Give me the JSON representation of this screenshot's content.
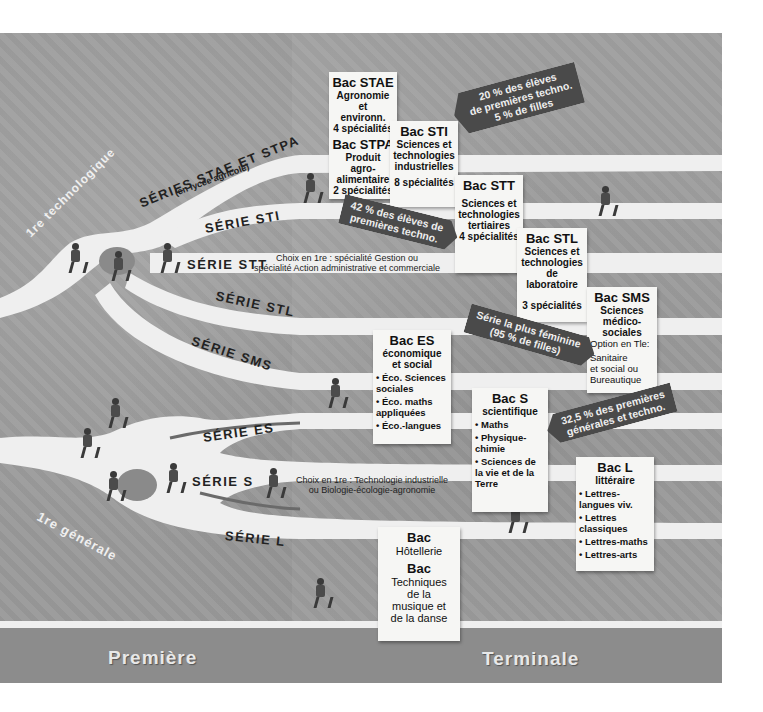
{
  "stages": {
    "premiere": "Première",
    "terminale": "Terminale"
  },
  "entry_labels": {
    "techno": "1re technologique",
    "generale": "1re générale"
  },
  "series": [
    {
      "id": "stae_stpa",
      "label": "SÉRIES STAE ET STPA",
      "sublabel": "(en lycée agricole)"
    },
    {
      "id": "sti",
      "label": "SÉRIE STI"
    },
    {
      "id": "stt",
      "label": "SÉRIE STT",
      "note_line1": "Choix en 1re : spécialité Gestion ou",
      "note_line2": "spécialité Action administrative et commerciale"
    },
    {
      "id": "stl",
      "label": "SÉRIE STL"
    },
    {
      "id": "sms",
      "label": "SÉRIE SMS"
    },
    {
      "id": "es",
      "label": "SÉRIE ES"
    },
    {
      "id": "s",
      "label": "SÉRIE S",
      "note_line1": "Choix en 1re : Technologie industrielle",
      "note_line2": "ou Biologie-écologie-agronomie"
    },
    {
      "id": "l",
      "label": "SÉRIE L"
    }
  ],
  "bacs": {
    "stae": {
      "title": "Bac STAE",
      "subtitle_1": "Agronomie et",
      "subtitle_2": "environn.",
      "count": "4 spécialités"
    },
    "stpa": {
      "title": "Bac STPA",
      "subtitle_1": "Produit agro-",
      "subtitle_2": "alimentaire",
      "count": "2 spécialités"
    },
    "sti": {
      "title": "Bac STI",
      "subtitle_1": "Sciences et",
      "subtitle_2": "technologies",
      "subtitle_3": "industrielles",
      "count": "8 spécialités"
    },
    "stt": {
      "title": "Bac STT",
      "subtitle_1": "Sciences et",
      "subtitle_2": "technologies",
      "subtitle_3": "tertiaires",
      "count": "4 spécialités"
    },
    "stl": {
      "title": "Bac STL",
      "subtitle_1": "Sciences et",
      "subtitle_2": "technologies",
      "subtitle_3": "de laboratoire",
      "count": "3 spécialités"
    },
    "sms": {
      "title": "Bac SMS",
      "subtitle_1": "Sciences",
      "subtitle_2": "médico-",
      "subtitle_3": "sociales",
      "option": "Option en Tle:",
      "opt_1": "Sanitaire",
      "opt_2": "et social ou",
      "opt_3": "Bureautique"
    },
    "es": {
      "title": "Bac ES",
      "subtitle_1": "économique",
      "subtitle_2": "et social",
      "items": [
        "• Éco. Sciences sociales",
        "• Éco. maths appliquées",
        "• Éco.-langues"
      ]
    },
    "s": {
      "title": "Bac S",
      "subtitle_1": "scientifique",
      "items": [
        "• Maths",
        "• Physique-chimie",
        "• Sciences de la vie et de la Terre"
      ]
    },
    "l": {
      "title": "Bac L",
      "subtitle_1": "littéraire",
      "items": [
        "• Lettres-langues viv.",
        "• Lettres classiques",
        "• Lettres-maths",
        "• Lettres-arts"
      ]
    },
    "hotellerie": {
      "title": "Bac",
      "subtitle_1": "Hôtellerie"
    },
    "musique": {
      "title": "Bac",
      "subtitle_1": "Techniques",
      "subtitle_2": "de la",
      "subtitle_3": "musique et",
      "subtitle_4": "de la danse"
    }
  },
  "banners": {
    "sti": {
      "line1": "20 % des élèves",
      "line2": "de premières techno.",
      "line3": "5 % de filles"
    },
    "stt": {
      "line1": "42 % des élèves de",
      "line2": "premières techno."
    },
    "sms": {
      "line1": "Série la plus féminine",
      "line2": "(95 % de filles)"
    },
    "s": {
      "line1": "32,5 % des premières",
      "line2": "générales et techno."
    }
  },
  "colors": {
    "background": "#9a9a9a",
    "road": "#efefef",
    "banner": "#4a4a4a",
    "card": "#f6f6f4",
    "floor": "#8c8c8c"
  }
}
